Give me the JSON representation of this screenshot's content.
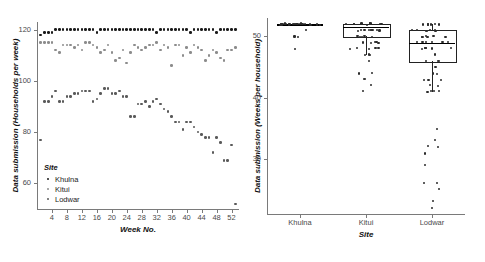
{
  "figure": {
    "panels": [
      "timeseries",
      "boxplot"
    ]
  },
  "left_panel": {
    "ylabel": "Data submission (Households per week)",
    "xlabel": "Week No.",
    "ytick_labels": [
      "60",
      "80",
      "100",
      "120"
    ],
    "xtick_labels": [
      "4",
      "8",
      "12",
      "16",
      "20",
      "24",
      "28",
      "32",
      "36",
      "40",
      "44",
      "48",
      "52"
    ],
    "legend": {
      "title": "Site",
      "items": [
        {
          "label": "Khulna",
          "color": "#1a1a1a"
        },
        {
          "label": "Kitui",
          "color": "#8c8c8c"
        },
        {
          "label": "Lodwar",
          "color": "#5a5a5a"
        }
      ]
    }
  },
  "right_panel": {
    "ylabel": "Data submission (Weeks per household)",
    "xlabel": "Site",
    "ytick_labels": [
      "30",
      "40",
      "50"
    ],
    "xtick_labels": [
      "Khulna",
      "Kitui",
      "Lodwar"
    ]
  },
  "chart_data": [
    {
      "type": "scatter",
      "id": "left-timeseries",
      "title": "",
      "xlabel": "Week No.",
      "ylabel": "Data submission (Households per week)",
      "xlim": [
        0,
        54
      ],
      "ylim": [
        50,
        123
      ],
      "grid": false,
      "legend_position": "inside-bottom-left",
      "legend_title": "Site",
      "x": [
        1,
        2,
        3,
        4,
        5,
        6,
        7,
        8,
        9,
        10,
        11,
        12,
        13,
        14,
        15,
        16,
        17,
        18,
        19,
        20,
        21,
        22,
        23,
        24,
        25,
        26,
        27,
        28,
        29,
        30,
        31,
        32,
        33,
        34,
        35,
        36,
        37,
        38,
        39,
        40,
        41,
        42,
        43,
        44,
        45,
        46,
        47,
        48,
        49,
        50,
        51,
        52,
        53
      ],
      "series": [
        {
          "name": "Khulna",
          "color": "#1a1a1a",
          "values": [
            118,
            119,
            119,
            119,
            120,
            120,
            120,
            120,
            120,
            120,
            120,
            120,
            120,
            120,
            120,
            119,
            120,
            120,
            120,
            120,
            120,
            120,
            120,
            120,
            120,
            120,
            120,
            120,
            120,
            120,
            120,
            119,
            120,
            120,
            120,
            120,
            120,
            120,
            120,
            120,
            119,
            120,
            120,
            120,
            120,
            120,
            120,
            119,
            120,
            120,
            120,
            120,
            120
          ]
        },
        {
          "name": "Kitui",
          "color": "#8c8c8c",
          "values": [
            115,
            115,
            115,
            115,
            112,
            111,
            114,
            114,
            114,
            113,
            114,
            112,
            115,
            115,
            114,
            113,
            111,
            112,
            114,
            111,
            108,
            109,
            112,
            107,
            111,
            114,
            113,
            112,
            113,
            114,
            114,
            115,
            112,
            114,
            113,
            106,
            114,
            114,
            110,
            113,
            111,
            114,
            113,
            112,
            108,
            110,
            112,
            111,
            109,
            108,
            112,
            112,
            113
          ]
        },
        {
          "name": "Lodwar",
          "color": "#5a5a5a",
          "values": [
            77,
            92,
            92,
            94,
            96,
            92,
            92,
            94,
            94,
            95,
            95,
            96,
            96,
            96,
            92,
            93,
            95,
            97,
            97,
            95,
            95,
            96,
            94,
            94,
            86,
            86,
            91,
            91,
            92,
            90,
            92,
            93,
            91,
            89,
            88,
            86,
            84,
            84,
            81,
            84,
            84,
            82,
            80,
            79,
            78,
            78,
            72,
            78,
            76,
            69,
            69,
            75,
            52
          ]
        }
      ]
    },
    {
      "type": "boxplot",
      "id": "right-boxplot",
      "title": "",
      "xlabel": "Site",
      "ylabel": "Data submission (Weeks per household)",
      "ylim": [
        21,
        53
      ],
      "grid": false,
      "categories": [
        "Khulna",
        "Kitui",
        "Lodwar"
      ],
      "boxes": [
        {
          "name": "Khulna",
          "q1": 52,
          "median": 52,
          "q3": 52,
          "whisker_low": 52,
          "whisker_high": 52,
          "points": [
            52,
            52,
            52,
            52,
            52,
            52,
            52,
            52,
            52,
            52,
            52,
            52,
            52,
            52,
            52,
            52,
            52,
            52,
            52,
            52,
            52,
            52,
            52,
            52,
            52,
            52,
            52,
            51,
            50,
            50,
            48
          ]
        },
        {
          "name": "Kitui",
          "q1": 50,
          "median": 51.5,
          "q3": 52,
          "whisker_low": 47,
          "whisker_high": 52,
          "points": [
            52,
            52,
            52,
            52,
            52,
            52,
            52,
            52,
            52,
            51,
            51,
            51,
            51,
            51,
            51,
            51,
            51,
            51,
            50,
            50,
            50,
            50,
            50,
            49,
            49,
            49,
            49,
            49,
            48,
            48,
            48,
            48,
            48,
            47,
            47,
            47,
            46,
            44,
            44,
            43,
            43,
            42,
            41
          ]
        },
        {
          "name": "Lodwar",
          "q1": 46,
          "median": 49,
          "q3": 51,
          "whisker_low": 41,
          "whisker_high": 52,
          "points": [
            52,
            52,
            52,
            52,
            52,
            52,
            51,
            51,
            51,
            51,
            51,
            51,
            51,
            50,
            50,
            50,
            50,
            50,
            50,
            49,
            49,
            49,
            49,
            49,
            49,
            48,
            48,
            48,
            48,
            48,
            47,
            46,
            46,
            46,
            45,
            44,
            44,
            43,
            43,
            43,
            42,
            42,
            41,
            41,
            41,
            41,
            35,
            33,
            32,
            32,
            31,
            29,
            26,
            26,
            25,
            23,
            22
          ]
        }
      ]
    }
  ]
}
